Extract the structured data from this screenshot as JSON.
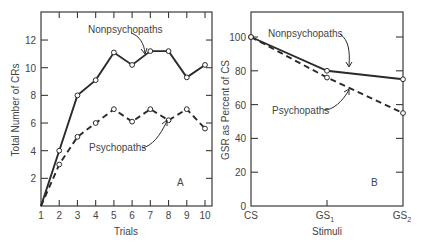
{
  "chart_data": [
    {
      "panel": "A",
      "type": "line",
      "xlabel": "Trials",
      "ylabel": "Total Number of CRs",
      "x": [
        1,
        2,
        3,
        4,
        5,
        6,
        7,
        8,
        9,
        10
      ],
      "x_tick_labels": [
        "1",
        "2",
        "3",
        "4",
        "5",
        "6",
        "7",
        "8",
        "9",
        "10"
      ],
      "y_ticks": [
        2,
        4,
        6,
        8,
        10,
        12
      ],
      "y_tick_labels": [
        "2",
        "4",
        "6",
        "8",
        "10",
        "12"
      ],
      "ylim": [
        0,
        14
      ],
      "xlim": [
        1,
        10
      ],
      "grid": false,
      "series": [
        {
          "name": "Nonpsychopaths",
          "style": "solid",
          "values": [
            0,
            4.0,
            8.0,
            9.1,
            11.1,
            10.2,
            11.2,
            11.2,
            9.3,
            10.2
          ]
        },
        {
          "name": "Psychopaths",
          "style": "dashed",
          "values": [
            0,
            3.0,
            5.0,
            6.0,
            7.0,
            6.1,
            7.0,
            6.2,
            7.0,
            5.6
          ]
        }
      ],
      "annotations": [
        "Nonpsychopaths",
        "Psychopaths",
        "A"
      ]
    },
    {
      "panel": "B",
      "type": "line",
      "xlabel": "Stimuli",
      "ylabel": "GSR as Percent of CS",
      "categories": [
        "CS",
        "GS1",
        "GS2"
      ],
      "y_ticks": [
        0,
        20,
        40,
        60,
        80,
        100
      ],
      "y_tick_labels": [
        "0",
        "20",
        "40",
        "60",
        "80",
        "100"
      ],
      "ylim": [
        0,
        115
      ],
      "grid": false,
      "series": [
        {
          "name": "Nonpsychopaths",
          "style": "solid",
          "values": [
            100,
            80,
            75
          ]
        },
        {
          "name": "Psychopaths",
          "style": "dashed",
          "values": [
            100,
            76,
            55
          ]
        }
      ],
      "annotations": [
        "Nonpsychopaths",
        "Psychopaths",
        "B"
      ]
    }
  ],
  "panelA": {
    "xlabel": "Trials",
    "ylabel": "Total Number of CRs",
    "tag": "A",
    "nonpsych_label": "Nonpsychopaths",
    "psych_label": "Psychopaths"
  },
  "panelB": {
    "xlabel": "Stimuli",
    "ylabel": "GSR as Percent of CS",
    "tag": "B",
    "nonpsych_label": "Nonpsychopaths",
    "psych_label": "Psychopaths",
    "x_labels": {
      "cs": "CS",
      "gs1_main": "GS",
      "gs1_sub": "1",
      "gs2_main": "GS",
      "gs2_sub": "2"
    }
  }
}
